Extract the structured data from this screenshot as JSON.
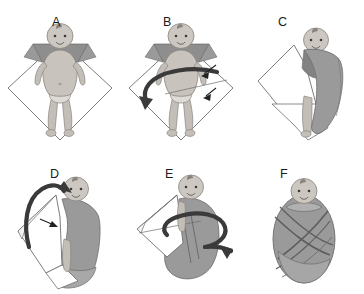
{
  "figure": {
    "background_color": "#ffffff",
    "panel_count": 6,
    "columns": 3,
    "rows": 2
  },
  "palette": {
    "blanket_front": "#ffffff",
    "blanket_gray": "#9a9a9a",
    "blanket_gray_dark": "#828282",
    "blanket_gray_light": "#b4b4b4",
    "outline": "#555555",
    "skin": "#c9c3bd",
    "skin_shadow": "#aaa49e",
    "arrow": "#3a3a3a",
    "label_text": "#1b1b1b",
    "line_thin": "#6e6e6e"
  },
  "panels": [
    {
      "id": "a",
      "label": "A",
      "caption_text": "A",
      "step_description": "Baby laid on diamond-folded blanket with top corner folded down behind the shoulders",
      "has_arrows": false,
      "arrow_count": 0,
      "blanket_state": "open-diamond",
      "label_x": 52,
      "label_y": 16
    },
    {
      "id": "b",
      "label": "B",
      "caption_text": "B",
      "step_description": "Large curved arrow shows pulling the left corner of the blanket across the baby's body; small arrows point to tucking side",
      "has_arrows": true,
      "arrow_count": 3,
      "blanket_state": "open-diamond",
      "label_x": 163,
      "label_y": 16
    },
    {
      "id": "c",
      "label": "C",
      "caption_text": "C",
      "step_description": "Blanket corner wrapped over the baby's body and tucked underneath",
      "has_arrows": false,
      "arrow_count": 0,
      "blanket_state": "one-side-wrapped",
      "label_x": 278,
      "label_y": 16
    },
    {
      "id": "d",
      "label": "D",
      "caption_text": "D",
      "step_description": "Hooked arrow shows folding the bottom corner up over the feet; small arrow points into the flap",
      "has_arrows": true,
      "arrow_count": 2,
      "blanket_state": "bottom-folded-up",
      "label_x": 50,
      "label_y": 168
    },
    {
      "id": "e",
      "label": "E",
      "caption_text": "E",
      "step_description": "Large encircling arrow shows bringing the remaining corner around the body",
      "has_arrows": true,
      "arrow_count": 1,
      "blanket_state": "final-wrap-in-progress",
      "label_x": 165,
      "label_y": 168
    },
    {
      "id": "f",
      "label": "F",
      "caption_text": "F",
      "step_description": "Finished swaddle: baby wrapped snugly in a cocoon shape",
      "has_arrows": false,
      "arrow_count": 0,
      "blanket_state": "complete",
      "label_x": 280,
      "label_y": 168
    }
  ]
}
